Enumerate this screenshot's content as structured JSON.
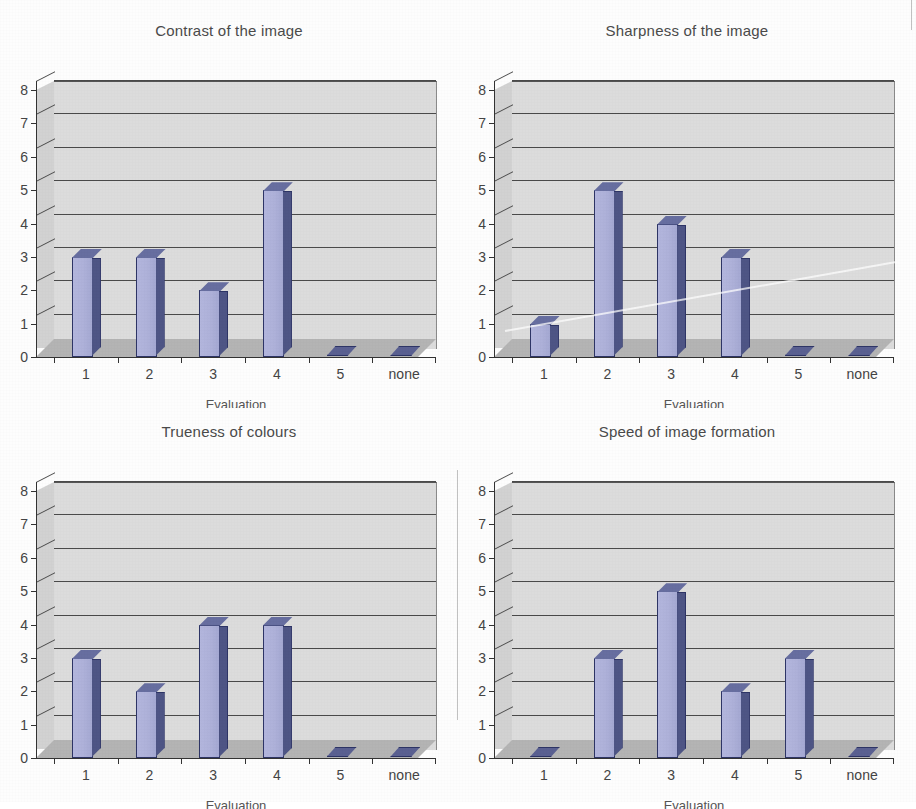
{
  "page": {
    "background_color": "#fdfdfd",
    "plot_area_color": "#dcdcdc",
    "floor_color": "#b4b4b4",
    "bar_face_color": "#b3b6dd",
    "bar_side_color": "#4e5585",
    "bar_outline_color": "#2e3566",
    "gridline_color": "#4a4a4a",
    "axis_color": "#333333",
    "text_color": "#444444"
  },
  "shared": {
    "x_axis_title": "Evaluation",
    "categories": [
      "1",
      "2",
      "3",
      "4",
      "5",
      "none"
    ],
    "y_ticks": [
      "0",
      "1",
      "2",
      "3",
      "4",
      "5",
      "6",
      "7",
      "8"
    ],
    "y_min": 0,
    "y_max": 8
  },
  "chart_data": [
    {
      "id": "contrast",
      "type": "bar",
      "title": "Contrast of the image",
      "xlabel": "Evaluation",
      "ylabel": "",
      "categories": [
        "1",
        "2",
        "3",
        "4",
        "5",
        "none"
      ],
      "values": [
        3,
        3,
        2,
        5,
        0,
        0
      ],
      "ylim": [
        0,
        8
      ],
      "ytick_step": 1,
      "grid": true,
      "legend": "none",
      "position": "top-left"
    },
    {
      "id": "sharpness",
      "type": "bar",
      "title": "Sharpness of the image",
      "xlabel": "Evaluation",
      "ylabel": "",
      "categories": [
        "1",
        "2",
        "3",
        "4",
        "5",
        "none"
      ],
      "values": [
        1,
        5,
        4,
        3,
        0,
        0
      ],
      "ylim": [
        0,
        8
      ],
      "ytick_step": 1,
      "grid": true,
      "legend": "none",
      "position": "top-right"
    },
    {
      "id": "trueness",
      "type": "bar",
      "title": "Trueness of colours",
      "xlabel": "Evaluation",
      "ylabel": "",
      "categories": [
        "1",
        "2",
        "3",
        "4",
        "5",
        "none"
      ],
      "values": [
        3,
        2,
        4,
        4,
        0,
        0
      ],
      "ylim": [
        0,
        8
      ],
      "ytick_step": 1,
      "grid": true,
      "legend": "none",
      "position": "bottom-left"
    },
    {
      "id": "speed",
      "type": "bar",
      "title": "Speed of image formation",
      "xlabel": "Evaluation",
      "ylabel": "",
      "categories": [
        "1",
        "2",
        "3",
        "4",
        "5",
        "none"
      ],
      "values": [
        0,
        3,
        5,
        2,
        3,
        0
      ],
      "ylim": [
        0,
        8
      ],
      "ytick_step": 1,
      "grid": true,
      "legend": "none",
      "position": "bottom-right"
    }
  ]
}
